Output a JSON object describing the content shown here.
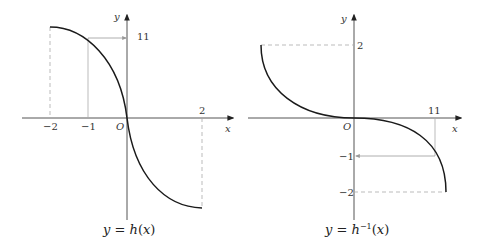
{
  "left_graph": {
    "caption_prefix": "y = ",
    "caption_fn": "h",
    "caption_arg": "(x)",
    "axis_x_label": "x",
    "axis_y_label": "y",
    "origin_label": "O",
    "x_ticks": [
      "−2",
      "−1",
      "2"
    ],
    "y_marker_label": "11"
  },
  "right_graph": {
    "caption_prefix": "y = ",
    "caption_fn": "h",
    "caption_sup": "−1",
    "caption_arg": "(x)",
    "axis_x_label": "x",
    "axis_y_label": "y",
    "origin_label": "O",
    "x_marker_label": "11",
    "y_ticks": [
      "2",
      "−1",
      "−2"
    ]
  },
  "colors": {
    "curve": "#1a1a1a",
    "axis": "#555555",
    "guide": "#aaaaaa"
  }
}
